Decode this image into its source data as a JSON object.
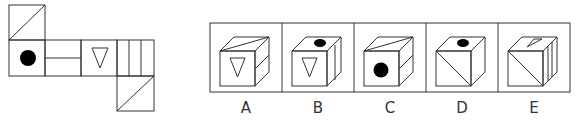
{
  "puzzle": {
    "type": "cube-net-folding",
    "net": {
      "faces": [
        {
          "id": "top",
          "pattern": "diagonal-line"
        },
        {
          "id": "left",
          "pattern": "black-dot"
        },
        {
          "id": "center-left",
          "pattern": "horizontal-line"
        },
        {
          "id": "center",
          "pattern": "inverted-triangle"
        },
        {
          "id": "right",
          "pattern": "three-vertical-lines"
        },
        {
          "id": "bottom",
          "pattern": "diagonal-line"
        }
      ]
    },
    "options": [
      {
        "label": "A",
        "front": "inverted-triangle",
        "top": "diagonal-line",
        "side": "horizontal-line"
      },
      {
        "label": "B",
        "front": "inverted-triangle",
        "top": "black-dot",
        "side": "vertical-line"
      },
      {
        "label": "C",
        "front": "black-dot",
        "top": "diagonal-line",
        "side": "horizontal-line"
      },
      {
        "label": "D",
        "front": "diagonal-line",
        "top": "black-dot",
        "side": "blank"
      },
      {
        "label": "E",
        "front": "diagonal-line",
        "top": "small-triangle",
        "side": "two-vertical-lines"
      }
    ]
  },
  "colors": {
    "stroke": "#333333",
    "fill": "#000000"
  }
}
